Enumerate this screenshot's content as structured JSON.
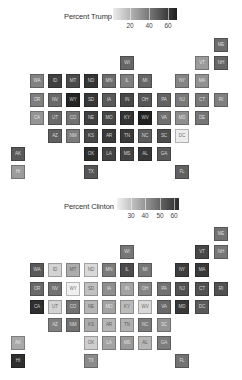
{
  "layout": {
    "col_x": [
      11,
      30,
      48,
      66,
      84,
      102,
      120,
      138,
      157,
      175,
      195,
      214
    ],
    "row_offsets": [
      0,
      18,
      36,
      55,
      73,
      91,
      109,
      127
    ]
  },
  "maps": [
    {
      "id": "trump",
      "top": 0,
      "grid_top": 38,
      "legend": {
        "title": "Percent Trump",
        "title_x": 64,
        "title_y": 12,
        "bar_x": 113,
        "bar_y": 8,
        "bar_w": 64,
        "range": [
          4,
          70
        ],
        "ticks": [
          {
            "label": "20",
            "x": 130
          },
          {
            "label": "40",
            "x": 149
          },
          {
            "label": "60",
            "x": 168
          }
        ],
        "colors": {
          "light": "#ececec",
          "dark": "#1e1e1e"
        }
      },
      "tiles": [
        {
          "state": "ME",
          "col": 11,
          "row": 0,
          "value": 45
        },
        {
          "state": "WI",
          "col": 6,
          "row": 1,
          "value": 47
        },
        {
          "state": "VT",
          "col": 10,
          "row": 1,
          "value": 30
        },
        {
          "state": "NH",
          "col": 11,
          "row": 1,
          "value": 47
        },
        {
          "state": "WA",
          "col": 1,
          "row": 2,
          "value": 38
        },
        {
          "state": "ID",
          "col": 2,
          "row": 2,
          "value": 59
        },
        {
          "state": "MT",
          "col": 3,
          "row": 2,
          "value": 56
        },
        {
          "state": "ND",
          "col": 4,
          "row": 2,
          "value": 63
        },
        {
          "state": "MN",
          "col": 5,
          "row": 2,
          "value": 45
        },
        {
          "state": "IL",
          "col": 6,
          "row": 2,
          "value": 39
        },
        {
          "state": "MI",
          "col": 7,
          "row": 2,
          "value": 47
        },
        {
          "state": "NY",
          "col": 9,
          "row": 2,
          "value": 37
        },
        {
          "state": "MA",
          "col": 10,
          "row": 2,
          "value": 33
        },
        {
          "state": "OR",
          "col": 1,
          "row": 3,
          "value": 39
        },
        {
          "state": "NV",
          "col": 2,
          "row": 3,
          "value": 46
        },
        {
          "state": "WY",
          "col": 3,
          "row": 3,
          "value": 68
        },
        {
          "state": "SD",
          "col": 4,
          "row": 3,
          "value": 62
        },
        {
          "state": "IA",
          "col": 5,
          "row": 3,
          "value": 51
        },
        {
          "state": "IN",
          "col": 6,
          "row": 3,
          "value": 57
        },
        {
          "state": "OH",
          "col": 7,
          "row": 3,
          "value": 52
        },
        {
          "state": "PA",
          "col": 8,
          "row": 3,
          "value": 48
        },
        {
          "state": "NJ",
          "col": 9,
          "row": 3,
          "value": 41
        },
        {
          "state": "CT",
          "col": 10,
          "row": 3,
          "value": 41
        },
        {
          "state": "RI",
          "col": 11,
          "row": 3,
          "value": 39
        },
        {
          "state": "CA",
          "col": 1,
          "row": 4,
          "value": 32
        },
        {
          "state": "UT",
          "col": 2,
          "row": 4,
          "value": 46
        },
        {
          "state": "CO",
          "col": 3,
          "row": 4,
          "value": 43
        },
        {
          "state": "NE",
          "col": 4,
          "row": 4,
          "value": 59
        },
        {
          "state": "MO",
          "col": 5,
          "row": 4,
          "value": 57
        },
        {
          "state": "KY",
          "col": 6,
          "row": 4,
          "value": 63
        },
        {
          "state": "WV",
          "col": 7,
          "row": 4,
          "value": 69
        },
        {
          "state": "VA",
          "col": 8,
          "row": 4,
          "value": 44
        },
        {
          "state": "MD",
          "col": 9,
          "row": 4,
          "value": 34
        },
        {
          "state": "DE",
          "col": 10,
          "row": 4,
          "value": 42
        },
        {
          "state": "AZ",
          "col": 2,
          "row": 5,
          "value": 49
        },
        {
          "state": "NM",
          "col": 3,
          "row": 5,
          "value": 40
        },
        {
          "state": "KS",
          "col": 4,
          "row": 5,
          "value": 57
        },
        {
          "state": "AR",
          "col": 5,
          "row": 5,
          "value": 61
        },
        {
          "state": "TN",
          "col": 6,
          "row": 5,
          "value": 61
        },
        {
          "state": "NC",
          "col": 7,
          "row": 5,
          "value": 50
        },
        {
          "state": "SC",
          "col": 8,
          "row": 5,
          "value": 55
        },
        {
          "state": "DC",
          "col": 9,
          "row": 5,
          "value": 4
        },
        {
          "state": "AK",
          "col": 0,
          "row": 6,
          "value": 51
        },
        {
          "state": "OK",
          "col": 4,
          "row": 6,
          "value": 65
        },
        {
          "state": "LA",
          "col": 5,
          "row": 6,
          "value": 58
        },
        {
          "state": "MS",
          "col": 6,
          "row": 6,
          "value": 58
        },
        {
          "state": "AL",
          "col": 7,
          "row": 6,
          "value": 62
        },
        {
          "state": "GA",
          "col": 8,
          "row": 6,
          "value": 51
        },
        {
          "state": "HI",
          "col": 0,
          "row": 7,
          "value": 30
        },
        {
          "state": "TX",
          "col": 4,
          "row": 7,
          "value": 52
        },
        {
          "state": "FL",
          "col": 9,
          "row": 7,
          "value": 49
        }
      ]
    },
    {
      "id": "clinton",
      "top": 189,
      "grid_top": 38,
      "legend": {
        "title": "Percent Clinton",
        "title_x": 64,
        "title_y": 13,
        "bar_x": 117,
        "bar_y": 9,
        "bar_w": 62,
        "range": [
          22,
          63
        ],
        "ticks": [
          {
            "label": "30",
            "x": 131
          },
          {
            "label": "40",
            "x": 145
          },
          {
            "label": "50",
            "x": 160
          },
          {
            "label": "60",
            "x": 174
          }
        ],
        "colors": {
          "light": "#f0f0f0",
          "dark": "#2a2a2a"
        }
      },
      "tiles": [
        {
          "state": "ME",
          "col": 11,
          "row": 0,
          "value": 48
        },
        {
          "state": "WI",
          "col": 6,
          "row": 1,
          "value": 47
        },
        {
          "state": "VT",
          "col": 10,
          "row": 1,
          "value": 57
        },
        {
          "state": "NH",
          "col": 11,
          "row": 1,
          "value": 47
        },
        {
          "state": "WA",
          "col": 1,
          "row": 2,
          "value": 53
        },
        {
          "state": "ID",
          "col": 2,
          "row": 2,
          "value": 28
        },
        {
          "state": "MT",
          "col": 3,
          "row": 2,
          "value": 36
        },
        {
          "state": "ND",
          "col": 4,
          "row": 2,
          "value": 27
        },
        {
          "state": "MN",
          "col": 5,
          "row": 2,
          "value": 46
        },
        {
          "state": "IL",
          "col": 6,
          "row": 2,
          "value": 56
        },
        {
          "state": "MI",
          "col": 7,
          "row": 2,
          "value": 47
        },
        {
          "state": "NY",
          "col": 9,
          "row": 2,
          "value": 59
        },
        {
          "state": "MA",
          "col": 10,
          "row": 2,
          "value": 60
        },
        {
          "state": "OR",
          "col": 1,
          "row": 3,
          "value": 50
        },
        {
          "state": "NV",
          "col": 2,
          "row": 3,
          "value": 48
        },
        {
          "state": "WY",
          "col": 3,
          "row": 3,
          "value": 22
        },
        {
          "state": "SD",
          "col": 4,
          "row": 3,
          "value": 32
        },
        {
          "state": "IA",
          "col": 5,
          "row": 3,
          "value": 42
        },
        {
          "state": "IN",
          "col": 6,
          "row": 3,
          "value": 38
        },
        {
          "state": "OH",
          "col": 7,
          "row": 3,
          "value": 44
        },
        {
          "state": "PA",
          "col": 8,
          "row": 3,
          "value": 48
        },
        {
          "state": "NJ",
          "col": 9,
          "row": 3,
          "value": 55
        },
        {
          "state": "CT",
          "col": 10,
          "row": 3,
          "value": 55
        },
        {
          "state": "RI",
          "col": 11,
          "row": 3,
          "value": 55
        },
        {
          "state": "CA",
          "col": 1,
          "row": 4,
          "value": 62
        },
        {
          "state": "UT",
          "col": 2,
          "row": 4,
          "value": 28
        },
        {
          "state": "CO",
          "col": 3,
          "row": 4,
          "value": 48
        },
        {
          "state": "NE",
          "col": 4,
          "row": 4,
          "value": 34
        },
        {
          "state": "MO",
          "col": 5,
          "row": 4,
          "value": 38
        },
        {
          "state": "KY",
          "col": 6,
          "row": 4,
          "value": 33
        },
        {
          "state": "WV",
          "col": 7,
          "row": 4,
          "value": 27
        },
        {
          "state": "VA",
          "col": 8,
          "row": 4,
          "value": 50
        },
        {
          "state": "MD",
          "col": 9,
          "row": 4,
          "value": 60
        },
        {
          "state": "DC",
          "col": 10,
          "row": 4,
          "value": 53
        },
        {
          "state": "AZ",
          "col": 2,
          "row": 5,
          "value": 45
        },
        {
          "state": "NM",
          "col": 3,
          "row": 5,
          "value": 48
        },
        {
          "state": "KS",
          "col": 4,
          "row": 5,
          "value": 36
        },
        {
          "state": "AR",
          "col": 5,
          "row": 5,
          "value": 34
        },
        {
          "state": "TN",
          "col": 6,
          "row": 5,
          "value": 35
        },
        {
          "state": "NC",
          "col": 7,
          "row": 5,
          "value": 46
        },
        {
          "state": "SC",
          "col": 8,
          "row": 5,
          "value": 41
        },
        {
          "state": "AK",
          "col": 0,
          "row": 6,
          "value": 37
        },
        {
          "state": "OK",
          "col": 4,
          "row": 6,
          "value": 29
        },
        {
          "state": "LA",
          "col": 5,
          "row": 6,
          "value": 38
        },
        {
          "state": "MS",
          "col": 6,
          "row": 6,
          "value": 40
        },
        {
          "state": "AL",
          "col": 7,
          "row": 6,
          "value": 34
        },
        {
          "state": "GA",
          "col": 8,
          "row": 6,
          "value": 46
        },
        {
          "state": "HI",
          "col": 0,
          "row": 7,
          "value": 62
        },
        {
          "state": "TX",
          "col": 4,
          "row": 7,
          "value": 43
        },
        {
          "state": "FL",
          "col": 9,
          "row": 7,
          "value": 48
        }
      ]
    }
  ]
}
